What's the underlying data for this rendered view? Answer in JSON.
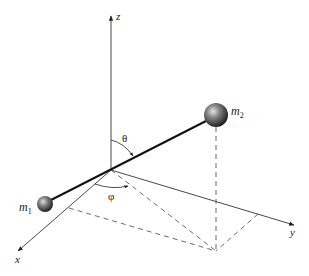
{
  "diagram": {
    "axes": {
      "z": {
        "label": "z",
        "origin": [
          111,
          170
        ],
        "tip": [
          111,
          15
        ]
      },
      "x": {
        "label": "x",
        "origin": [
          111,
          170
        ],
        "tip": [
          17,
          252
        ]
      },
      "y": {
        "label": "y",
        "origin": [
          111,
          170
        ],
        "tip": [
          295,
          225
        ]
      }
    },
    "masses": [
      {
        "id": "m1",
        "label": "m",
        "subscript": "1",
        "center": [
          45,
          204
        ],
        "radius": 8
      },
      {
        "id": "m2",
        "label": "m",
        "subscript": "2",
        "center": [
          216,
          115
        ],
        "radius": 12
      }
    ],
    "angles": {
      "theta": {
        "label": "θ"
      },
      "phi": {
        "label": "φ"
      }
    },
    "projection_point": [
      216,
      251
    ],
    "colors": {
      "line": "#222222",
      "sphere_dark": "#1a1a1a",
      "sphere_light": "#d8d8d8",
      "background": "#ffffff"
    }
  }
}
